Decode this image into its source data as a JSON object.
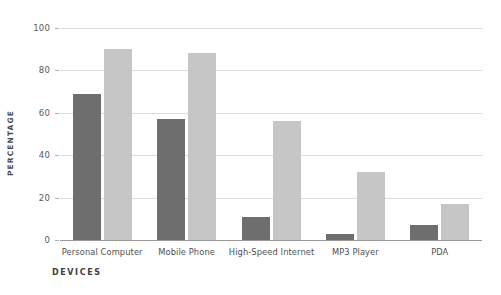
{
  "chart_data": {
    "type": "bar",
    "title": "",
    "xlabel": "DEVICES",
    "ylabel": "PERCENTAGE",
    "categories": [
      "Personal Computer",
      "Mobile Phone",
      "High-Speed Internet",
      "MP3 Player",
      "PDA"
    ],
    "series": [
      {
        "name": "Series 1",
        "color": "#6e6e6e",
        "values": [
          69,
          57,
          11,
          3,
          7
        ]
      },
      {
        "name": "Series 2",
        "color": "#c6c6c6",
        "values": [
          90,
          88,
          56,
          32,
          17
        ]
      }
    ],
    "ylim": [
      0,
      100
    ],
    "yticks": [
      0,
      20,
      40,
      60,
      80,
      100
    ],
    "ytick_labels": [
      "0",
      "20",
      "40",
      "60",
      "80",
      "100"
    ],
    "grid": true,
    "legend": "none"
  },
  "axes": {
    "y_title": "PERCENTAGE",
    "x_title": "DEVICES"
  },
  "colors": {
    "series_a": "#6e6e6e",
    "series_b": "#c6c6c6",
    "gridline": "#dcdcdc",
    "baseline": "#9a9a9a",
    "text": "#4f4f4f",
    "background": "#ffffff"
  }
}
